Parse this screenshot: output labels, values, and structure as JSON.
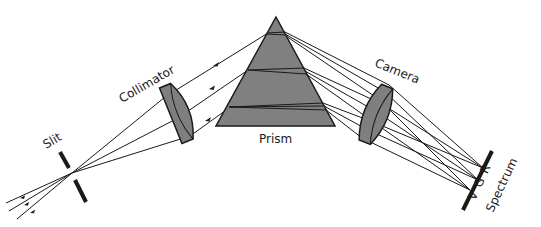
{
  "diagram": {
    "labels": {
      "slit": "Slit",
      "collimator": "Collimator",
      "prism": "Prism",
      "camera": "Camera",
      "spectrum_colors": "V G R",
      "spectrum": "Spectrum"
    },
    "colors": {
      "background": "#ffffff",
      "line": "#1a1a1a",
      "glass_fill": "#7f7f7f",
      "prism_fill": "#808080"
    }
  }
}
